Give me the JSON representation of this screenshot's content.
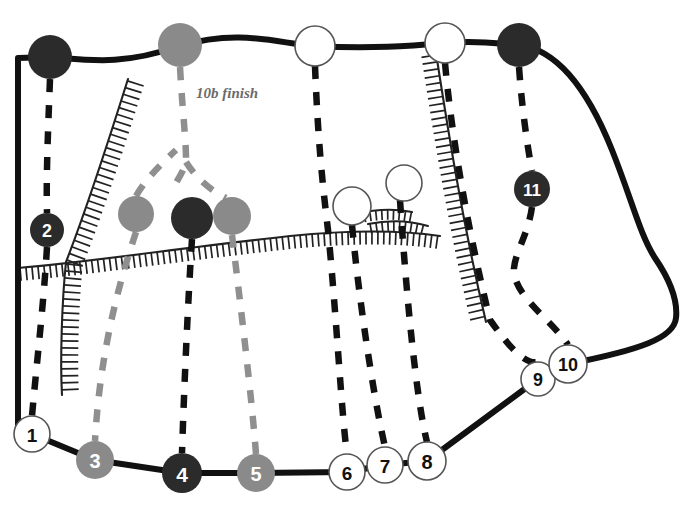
{
  "diagram": {
    "type": "route-topo",
    "background_color": "#ffffff",
    "colors": {
      "outline": "#111111",
      "dark_marker": "#2b2b2b",
      "gray_marker": "#8a8a8a",
      "white_marker": "#ffffff",
      "white_marker_stroke": "#555555",
      "dark_route": "#111111",
      "gray_route": "#8f8f8f",
      "annotation_text": "#6b6b6b",
      "hachure": "#222222"
    }
  },
  "annotations": [
    {
      "id": "finish-label",
      "text": "10b finish",
      "x": 196,
      "y": 98
    }
  ],
  "markers": [
    {
      "id": "m1",
      "label": "1",
      "x": 32,
      "y": 434,
      "r": 18,
      "style": "white"
    },
    {
      "id": "m2",
      "label": "2",
      "x": 47,
      "y": 230,
      "r": 17,
      "style": "dark"
    },
    {
      "id": "m3",
      "label": "3",
      "x": 95,
      "y": 460,
      "r": 19,
      "style": "gray"
    },
    {
      "id": "m4",
      "label": "4",
      "x": 182,
      "y": 473,
      "r": 20,
      "style": "dark"
    },
    {
      "id": "m5",
      "label": "5",
      "x": 256,
      "y": 473,
      "r": 19,
      "style": "gray"
    },
    {
      "id": "m6",
      "label": "6",
      "x": 347,
      "y": 472,
      "r": 18,
      "style": "white"
    },
    {
      "id": "m7",
      "label": "7",
      "x": 385,
      "y": 465,
      "r": 18,
      "style": "white"
    },
    {
      "id": "m8",
      "label": "8",
      "x": 427,
      "y": 461,
      "r": 19,
      "style": "white"
    },
    {
      "id": "m9",
      "label": "9",
      "x": 538,
      "y": 379,
      "r": 17,
      "style": "white"
    },
    {
      "id": "m10",
      "label": "10",
      "x": 568,
      "y": 364,
      "r": 19,
      "style": "white"
    },
    {
      "id": "m11",
      "label": "11",
      "x": 532,
      "y": 189,
      "r": 18,
      "style": "dark"
    }
  ],
  "anchors": [
    {
      "id": "a-top-left",
      "label": "",
      "x": 50,
      "y": 57,
      "r": 22,
      "style": "dark"
    },
    {
      "id": "a-top-gray",
      "label": "",
      "x": 180,
      "y": 45,
      "r": 22,
      "style": "gray"
    },
    {
      "id": "a-top-white-1",
      "label": "",
      "x": 315,
      "y": 46,
      "r": 20,
      "style": "white"
    },
    {
      "id": "a-top-white-2",
      "label": "",
      "x": 445,
      "y": 43,
      "r": 20,
      "style": "white"
    },
    {
      "id": "a-top-dark",
      "label": "",
      "x": 519,
      "y": 45,
      "r": 22,
      "style": "dark"
    },
    {
      "id": "a-mid-gray-1",
      "label": "",
      "x": 136,
      "y": 214,
      "r": 18,
      "style": "gray"
    },
    {
      "id": "a-mid-dark",
      "label": "",
      "x": 192,
      "y": 218,
      "r": 21,
      "style": "dark"
    },
    {
      "id": "a-mid-gray-2",
      "label": "",
      "x": 232,
      "y": 216,
      "r": 19,
      "style": "gray"
    },
    {
      "id": "a-mid-white-1",
      "label": "",
      "x": 352,
      "y": 206,
      "r": 19,
      "style": "white"
    },
    {
      "id": "a-mid-white-2",
      "label": "",
      "x": 404,
      "y": 183,
      "r": 18,
      "style": "white"
    }
  ],
  "crag_outline": {
    "id": "crag-outline",
    "path": "M 18,58 L 18,432 M 18,58 L 50,57 C 90,60 120,66 180,46 C 240,28 280,44 315,46 C 370,49 410,46 445,43 C 480,40 500,44 519,45 C 560,50 590,95 612,150 C 632,200 640,235 655,258 C 670,280 678,300 676,318 C 674,338 640,350 568,364 L 538,379 L 427,461 L 385,465 L 347,472 L 256,473 L 182,473 L 95,460 L 32,434 L 18,432"
  },
  "routes": [
    {
      "id": "route-1",
      "color": "dark",
      "path": "M 50,79 C 48,130 46,180 47,213"
    },
    {
      "id": "route-1b",
      "color": "dark",
      "path": "M 47,247 C 44,300 36,370 32,416"
    },
    {
      "id": "route-3",
      "color": "gray",
      "path": "M 136,232 C 120,280 100,350 95,441"
    },
    {
      "id": "route-3u",
      "color": "gray",
      "path": "M 136,196 C 145,180 160,165 176,150"
    },
    {
      "id": "route-10b",
      "color": "gray",
      "path": "M 180,67 C 182,105 186,140 186,158 C 186,170 176,180 172,192"
    },
    {
      "id": "route-10b-branch",
      "color": "gray",
      "path": "M 186,162 C 196,178 210,190 226,198"
    },
    {
      "id": "route-4",
      "color": "dark",
      "path": "M 192,239 C 188,300 184,390 182,453"
    },
    {
      "id": "route-5",
      "color": "gray",
      "path": "M 232,235 C 240,300 252,400 256,454"
    },
    {
      "id": "route-6",
      "color": "dark",
      "path": "M 315,66 C 318,140 322,180 328,230 C 336,310 342,420 347,454"
    },
    {
      "id": "route-7",
      "color": "dark",
      "path": "M 352,225 C 358,290 372,390 385,447"
    },
    {
      "id": "route-8",
      "color": "dark",
      "path": "M 400,200 C 404,260 414,390 427,442"
    },
    {
      "id": "route-9",
      "color": "dark",
      "path": "M 445,63 C 452,140 468,230 490,320 C 508,345 524,365 538,362"
    },
    {
      "id": "route-11",
      "color": "dark",
      "path": "M 519,67 C 522,110 528,150 532,171"
    },
    {
      "id": "route-11b",
      "color": "dark",
      "path": "M 532,207 C 528,235 516,250 514,268 C 512,295 552,320 568,345"
    }
  ],
  "hachure_ridges": [
    {
      "id": "ridge-left-upper",
      "path": "M 128,79 C 112,130 90,200 66,262",
      "side": "right",
      "length": 17,
      "spacing": 7
    },
    {
      "id": "ridge-left-lower",
      "path": "M 66,262 C 62,300 60,360 62,395",
      "side": "right",
      "length": 17,
      "spacing": 7
    },
    {
      "id": "ridge-band",
      "path": "M 18,268 C 90,262 180,248 290,236 C 350,230 400,230 440,236",
      "side": "left",
      "length": 13,
      "spacing": 6
    },
    {
      "id": "ridge-right",
      "path": "M 436,53 C 448,130 462,220 486,322",
      "side": "left",
      "length": 15,
      "spacing": 7
    },
    {
      "id": "ridge-small-1",
      "path": "M 356,214 C 372,210 392,208 412,212",
      "side": "left",
      "length": 10,
      "spacing": 6
    },
    {
      "id": "ridge-small-2",
      "path": "M 368,224 C 388,220 408,220 428,226",
      "side": "left",
      "length": 10,
      "spacing": 6
    }
  ]
}
